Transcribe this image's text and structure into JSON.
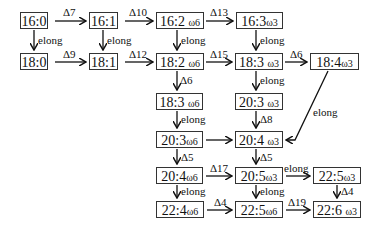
{
  "diagram": {
    "nodes": [
      {
        "id": "n16_0",
        "label": "16:0",
        "omega": "",
        "x": 20,
        "y": 12,
        "w": 28
      },
      {
        "id": "n16_1",
        "label": "16:1",
        "omega": "",
        "x": 89,
        "y": 12,
        "w": 29
      },
      {
        "id": "n16_2",
        "label": "16:2",
        "omega": "ω6",
        "x": 156,
        "y": 12,
        "w": 48
      },
      {
        "id": "n16_3",
        "label": "16:3",
        "omega": "ω3",
        "x": 236,
        "y": 12,
        "w": 47
      },
      {
        "id": "n18_0",
        "label": "18:0",
        "omega": "",
        "x": 20,
        "y": 53,
        "w": 28
      },
      {
        "id": "n18_1",
        "label": "18:1",
        "omega": "",
        "x": 89,
        "y": 53,
        "w": 29
      },
      {
        "id": "n18_2",
        "label": "18:2",
        "omega": "ω6",
        "x": 156,
        "y": 53,
        "w": 48
      },
      {
        "id": "n18_3w3",
        "label": "18:3",
        "omega": "ω3",
        "x": 235,
        "y": 53,
        "w": 48
      },
      {
        "id": "n18_4",
        "label": "18:4",
        "omega": "ω3",
        "x": 310,
        "y": 53,
        "w": 49
      },
      {
        "id": "n18_3w6",
        "label": "18:3",
        "omega": "ω6",
        "x": 156,
        "y": 93,
        "w": 47
      },
      {
        "id": "n20_3w3",
        "label": "20:3",
        "omega": "ω3",
        "x": 235,
        "y": 93,
        "w": 48
      },
      {
        "id": "n20_3w6",
        "label": "20:3",
        "omega": "ω6",
        "x": 156,
        "y": 131,
        "w": 47
      },
      {
        "id": "n20_4w3",
        "label": "20:4",
        "omega": "ω3",
        "x": 235,
        "y": 131,
        "w": 48
      },
      {
        "id": "n20_4w6",
        "label": "20:4",
        "omega": "ω6",
        "x": 156,
        "y": 167,
        "w": 47
      },
      {
        "id": "n20_5",
        "label": "20:5",
        "omega": "ω3",
        "x": 235,
        "y": 167,
        "w": 48
      },
      {
        "id": "n22_5w3",
        "label": "22:5",
        "omega": "ω3",
        "x": 313,
        "y": 167,
        "w": 48
      },
      {
        "id": "n22_4",
        "label": "22:4",
        "omega": "ω6",
        "x": 156,
        "y": 201,
        "w": 48
      },
      {
        "id": "n22_5w6",
        "label": "22:5",
        "omega": "ω6",
        "x": 235,
        "y": 201,
        "w": 48
      },
      {
        "id": "n22_6",
        "label": "22:6",
        "omega": "ω3",
        "x": 313,
        "y": 201,
        "w": 48
      }
    ],
    "edges": [
      {
        "from": "n16_0",
        "to": "n16_1",
        "label": "Δ7"
      },
      {
        "from": "n16_1",
        "to": "n16_2",
        "label": "Δ10"
      },
      {
        "from": "n16_2",
        "to": "n16_3",
        "label": "Δ13"
      },
      {
        "from": "n16_0",
        "to": "n18_0",
        "label": "elong"
      },
      {
        "from": "n16_1",
        "to": "n18_1",
        "label": "elong"
      },
      {
        "from": "n16_2",
        "to": "n18_2",
        "label": "elong"
      },
      {
        "from": "n16_3",
        "to": "n18_3w3",
        "label": "elong"
      },
      {
        "from": "n18_0",
        "to": "n18_1",
        "label": "Δ9"
      },
      {
        "from": "n18_1",
        "to": "n18_2",
        "label": "Δ12"
      },
      {
        "from": "n18_2",
        "to": "n18_3w3",
        "label": "Δ15"
      },
      {
        "from": "n18_3w3",
        "to": "n18_4",
        "label": "Δ6"
      },
      {
        "from": "n18_2",
        "to": "n18_3w6",
        "label": "Δ6"
      },
      {
        "from": "n18_3w3",
        "to": "n20_3w3",
        "label": "elong"
      },
      {
        "from": "n18_3w6",
        "to": "n20_3w6",
        "label": "elong"
      },
      {
        "from": "n20_3w3",
        "to": "n20_4w3",
        "label": "Δ8"
      },
      {
        "from": "n18_4",
        "to": "n20_4w3",
        "label": "elong"
      },
      {
        "from": "n20_3w6",
        "to": "n20_4w3",
        "label": ""
      },
      {
        "from": "n20_3w6",
        "to": "n20_4w6",
        "label": "Δ5"
      },
      {
        "from": "n20_4w3",
        "to": "n20_5",
        "label": "Δ5"
      },
      {
        "from": "n20_4w6",
        "to": "n20_5",
        "label": "Δ17"
      },
      {
        "from": "n20_5",
        "to": "n22_5w3",
        "label": "elong"
      },
      {
        "from": "n20_4w6",
        "to": "n22_4",
        "label": "elong"
      },
      {
        "from": "n20_5",
        "to": "n22_5w6",
        "label": "elong"
      },
      {
        "from": "n22_5w3",
        "to": "n22_6",
        "label": "Δ4"
      },
      {
        "from": "n22_4",
        "to": "n22_5w6",
        "label": "Δ4"
      },
      {
        "from": "n22_5w6",
        "to": "n22_6",
        "label": "Δ19"
      }
    ]
  },
  "labels": {
    "d7": "Δ7",
    "d10": "Δ10",
    "d13": "Δ13",
    "d9": "Δ9",
    "d12": "Δ12",
    "d15": "Δ15",
    "d6a": "Δ6",
    "d6b": "Δ6",
    "d8": "Δ8",
    "d5a": "Δ5",
    "d5b": "Δ5",
    "d17": "Δ17",
    "d4a": "Δ4",
    "d4b": "Δ4",
    "d19": "Δ19",
    "elong": "elong"
  }
}
